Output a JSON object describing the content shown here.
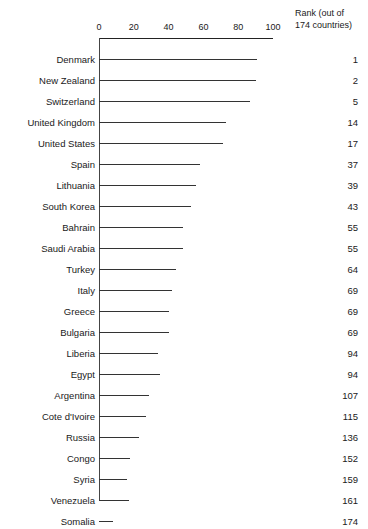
{
  "chart_data": {
    "type": "bar",
    "orientation": "horizontal",
    "title": "",
    "subtitle": "",
    "xlabel": "",
    "ylabel": "",
    "xlim": [
      0,
      100
    ],
    "xticks": [
      0,
      20,
      40,
      60,
      80,
      100
    ],
    "grid": false,
    "legend": false,
    "axis_position": "top",
    "categories": [
      "Denmark",
      "New Zealand",
      "Switzerland",
      "United Kingdom",
      "United States",
      "Spain",
      "Lithuania",
      "South Korea",
      "Bahrain",
      "Saudi Arabia",
      "Turkey",
      "Italy",
      "Greece",
      "Bulgaria",
      "Liberia",
      "Egypt",
      "Argentina",
      "Cote d'Ivoire",
      "Russia",
      "Congo",
      "Syria",
      "Venezuela",
      "Somalia"
    ],
    "values": [
      91,
      90,
      87,
      73,
      71,
      58,
      56,
      53,
      48,
      48,
      44,
      42,
      40,
      40,
      34,
      35,
      29,
      27,
      23,
      18,
      16,
      17,
      8
    ],
    "extra_column": {
      "header_line1": "Rank (out of",
      "header_line2": "174 countries)",
      "values": [
        1,
        2,
        5,
        14,
        17,
        37,
        39,
        43,
        55,
        55,
        64,
        69,
        69,
        69,
        94,
        94,
        107,
        115,
        136,
        152,
        159,
        161,
        174
      ]
    },
    "colors": {
      "bar": "#333333",
      "axis": "#222222",
      "text": "#1a1a1a",
      "background": "#ffffff"
    }
  }
}
